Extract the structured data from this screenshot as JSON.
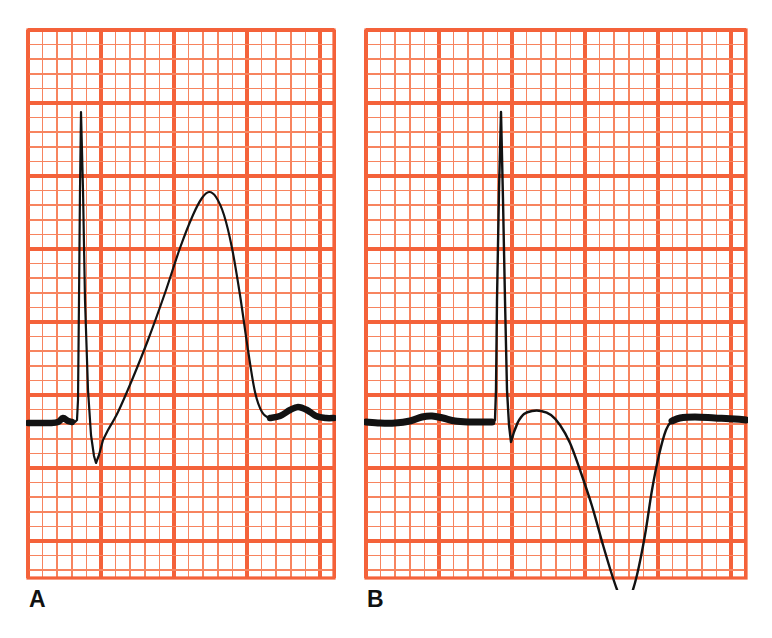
{
  "figure": {
    "kind": "ecg-strip-pair",
    "background_color": "#ffffff",
    "grid_color": "#f4623a",
    "grid_minor_color": "#f7845f",
    "trace_color": "#121212",
    "width": 772,
    "height": 638
  },
  "panels": [
    {
      "id": "A",
      "label": "A",
      "label_position": {
        "x": 29,
        "y": 588
      },
      "grid": {
        "x": 28,
        "y": 30,
        "width": 306,
        "height": 548,
        "minor_step": 14.6,
        "major_every": 5,
        "minor_width": 1.6,
        "major_width": 3.2
      },
      "baseline_y": 422,
      "description": "Normal upright T wave with tall R wave, deep narrow S wave and small U wave"
    },
    {
      "id": "B",
      "label": "B",
      "label_position": {
        "x": 367,
        "y": 588
      },
      "grid": {
        "x": 366,
        "y": 30,
        "width": 380,
        "height": 548,
        "minor_step": 14.6,
        "major_every": 5,
        "minor_width": 1.6,
        "major_width": 3.2
      },
      "baseline_y": 422,
      "description": "Tall R wave with deeply inverted symmetric T wave extending below the strip"
    }
  ],
  "chart_data": {
    "type": "line",
    "title": "",
    "subtitle": "",
    "xlabel": "",
    "ylabel": "",
    "grid": true,
    "legend_position": "none",
    "units": {
      "x": "mm (25 mm/s)",
      "y": "mm (10 mm/mV)"
    },
    "annotations": [
      {
        "text": "A",
        "x": 29,
        "y": 588
      },
      {
        "text": "B",
        "x": 367,
        "y": 588
      }
    ],
    "series": [
      {
        "name": "A",
        "label": "Panel A ECG complex",
        "color": "#121212",
        "baseline_y": 422,
        "features": {
          "p_wave": {
            "x": 63,
            "y": 417,
            "amplitude_px": 5
          },
          "q_onset": {
            "x": 76,
            "y": 422
          },
          "r_peak": {
            "x": 81,
            "y": 112,
            "amplitude_px": 310
          },
          "s_trough": {
            "x": 96,
            "y": 463,
            "amplitude_px": -41
          },
          "st_return": {
            "x": 106,
            "y": 430
          },
          "t_peak": {
            "x": 209,
            "y": 192,
            "amplitude_px": 230
          },
          "t_end": {
            "x": 262,
            "y": 414
          },
          "u_wave": {
            "x": 297,
            "y": 407,
            "amplitude_px": 15
          }
        },
        "points": [
          [
            28,
            423
          ],
          [
            40,
            423
          ],
          [
            50,
            423
          ],
          [
            58,
            422
          ],
          [
            63,
            418
          ],
          [
            68,
            421
          ],
          [
            72,
            422
          ],
          [
            75,
            422
          ],
          [
            77,
            420
          ],
          [
            78,
            400
          ],
          [
            79,
            300
          ],
          [
            80,
            190
          ],
          [
            81,
            112
          ],
          [
            83,
            190
          ],
          [
            85,
            300
          ],
          [
            88,
            390
          ],
          [
            91,
            435
          ],
          [
            94,
            456
          ],
          [
            96,
            463
          ],
          [
            99,
            455
          ],
          [
            103,
            440
          ],
          [
            108,
            430
          ],
          [
            118,
            412
          ],
          [
            132,
            380
          ],
          [
            148,
            340
          ],
          [
            165,
            293
          ],
          [
            180,
            248
          ],
          [
            193,
            215
          ],
          [
            202,
            198
          ],
          [
            209,
            192
          ],
          [
            216,
            197
          ],
          [
            224,
            215
          ],
          [
            232,
            248
          ],
          [
            240,
            295
          ],
          [
            248,
            350
          ],
          [
            255,
            392
          ],
          [
            262,
            412
          ],
          [
            270,
            418
          ],
          [
            280,
            416
          ],
          [
            290,
            410
          ],
          [
            298,
            407
          ],
          [
            307,
            410
          ],
          [
            316,
            416
          ],
          [
            326,
            418
          ],
          [
            334,
            418
          ]
        ]
      },
      {
        "name": "B",
        "label": "Panel B ECG complex",
        "color": "#121212",
        "baseline_y": 422,
        "features": {
          "p_wave": {
            "x": 430,
            "y": 416,
            "amplitude_px": 6
          },
          "q_onset": {
            "x": 495,
            "y": 422
          },
          "r_peak": {
            "x": 501,
            "y": 112,
            "amplitude_px": 310
          },
          "s_trough": {
            "x": 511,
            "y": 442,
            "amplitude_px": -20
          },
          "st_segment": {
            "x": 540,
            "y": 412
          },
          "t_trough": {
            "x": 625,
            "y": 604,
            "amplitude_px": -182
          },
          "t_end": {
            "x": 672,
            "y": 422
          }
        },
        "points": [
          [
            366,
            422
          ],
          [
            380,
            423
          ],
          [
            395,
            423
          ],
          [
            410,
            421
          ],
          [
            422,
            417
          ],
          [
            432,
            416
          ],
          [
            443,
            418
          ],
          [
            455,
            421
          ],
          [
            468,
            422
          ],
          [
            482,
            422
          ],
          [
            492,
            422
          ],
          [
            495,
            420
          ],
          [
            496,
            390
          ],
          [
            497,
            300
          ],
          [
            499,
            190
          ],
          [
            501,
            112
          ],
          [
            503,
            200
          ],
          [
            505,
            300
          ],
          [
            507,
            390
          ],
          [
            509,
            425
          ],
          [
            511,
            442
          ],
          [
            514,
            432
          ],
          [
            518,
            422
          ],
          [
            524,
            414
          ],
          [
            532,
            411
          ],
          [
            541,
            411
          ],
          [
            551,
            415
          ],
          [
            560,
            425
          ],
          [
            570,
            443
          ],
          [
            580,
            470
          ],
          [
            592,
            506
          ],
          [
            603,
            545
          ],
          [
            613,
            578
          ],
          [
            620,
            597
          ],
          [
            625,
            604
          ],
          [
            630,
            598
          ],
          [
            637,
            575
          ],
          [
            645,
            535
          ],
          [
            652,
            490
          ],
          [
            659,
            455
          ],
          [
            666,
            430
          ],
          [
            672,
            421
          ],
          [
            680,
            418
          ],
          [
            695,
            417
          ],
          [
            715,
            418
          ],
          [
            735,
            419
          ],
          [
            746,
            420
          ]
        ]
      }
    ]
  }
}
